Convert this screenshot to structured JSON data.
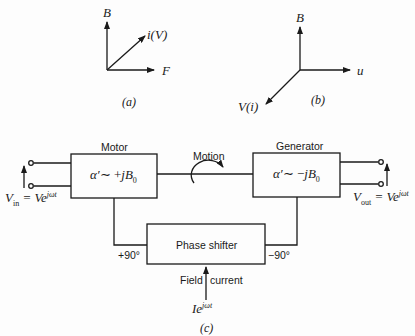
{
  "figure_a": {
    "caption": "(a)",
    "axis_up": "B",
    "axis_diag": "i(V)",
    "axis_right": "F"
  },
  "figure_b": {
    "caption": "(b)",
    "axis_up": "B",
    "axis_right": "u",
    "axis_diag": "V(i)"
  },
  "figure_c": {
    "caption": "(c)",
    "motor": {
      "title": "Motor",
      "formula_a": "α′",
      "formula_b": "∼ +",
      "formula_c": "jB",
      "formula_sub": "0"
    },
    "generator": {
      "title": "Generator",
      "formula_a": "α′",
      "formula_b": "∼ −",
      "formula_c": "jB",
      "formula_sub": "0"
    },
    "motion_label": "Motion",
    "phase_shifter": {
      "title": "Phase shifter",
      "left_phase": "+90°",
      "right_phase": "−90°"
    },
    "field_current": {
      "label_left": "Field",
      "label_right": "current",
      "source_base": "Ie",
      "source_exp": "jωt"
    },
    "input": {
      "v": "V",
      "sub": "in",
      "eq": " = Ve",
      "exp": "jωt"
    },
    "output": {
      "v": "V",
      "sub": "out",
      "eq": " = Ve",
      "exp": "jωt"
    }
  }
}
